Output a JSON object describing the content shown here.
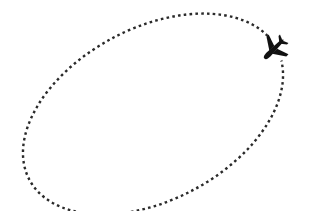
{
  "illustration": {
    "description": "Dotted elliptical flight path with airplane icon",
    "path": {
      "style": "dotted",
      "color": "#2a2a2a",
      "center": [
        153,
        114
      ],
      "rx": 140,
      "ry": 86,
      "rotation_deg": -28
    },
    "plane": {
      "icon": "airplane-icon",
      "color": "#111111",
      "position": [
        275,
        48
      ],
      "heading": "up-left"
    }
  }
}
